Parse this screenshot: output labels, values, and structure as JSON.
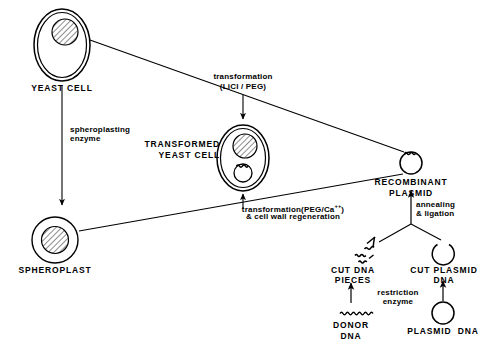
{
  "diagram": {
    "background_color": "#ffffff",
    "stroke_color": "#000000",
    "width": 490,
    "height": 356
  },
  "nodes": {
    "yeast_cell": {
      "label": "YEAST CELL",
      "shape": "double-walled-oval-with-hatched-nucleus"
    },
    "transformed_yeast_cell": {
      "label_line1": "TRANSFORMED",
      "label_line2": "YEAST CELL",
      "shape": "double-walled-oval-with-hatched-nucleus-and-plasmid"
    },
    "spheroplast": {
      "label": "SPHEROPLAST",
      "shape": "single-wall-circle-with-hatched-nucleus"
    },
    "recombinant_plasmid": {
      "label_line1": "RECOMBINANT",
      "label_line2": "PLASMID",
      "shape": "circle-with-squiggle-insert"
    },
    "cut_dna_pieces": {
      "label_line1": "CUT DNA",
      "label_line2": "PIECES",
      "shape": "squiggle-fragments"
    },
    "cut_plasmid_dna": {
      "label_line1": "CUT PLASMID",
      "label_line2": "DNA",
      "shape": "open-circle"
    },
    "donor_dna": {
      "label_line1": "DONOR",
      "label_line2": "DNA",
      "shape": "wavy-line"
    },
    "plasmid_dna": {
      "label": "PLASMID  DNA",
      "shape": "closed-circle"
    }
  },
  "process_labels": {
    "transformation_licl_peg_line1": "transformation",
    "transformation_licl_peg_line2": "(LiCI / PEG)",
    "spheroplasting_enzyme_line1": "spheroplasting",
    "spheroplasting_enzyme_line2": "enzyme",
    "transformation_peg_ca_line1_a": "transformation(PEG/Ca",
    "transformation_peg_ca_line1_sup": "++",
    "transformation_peg_ca_line1_b": ")",
    "transformation_peg_ca_line2": "& cell wall regeneration",
    "annealing_ligation_line1": "annealing",
    "annealing_ligation_line2": "& ligation",
    "restriction_enzyme_line1": "restriction",
    "restriction_enzyme_line2": "enzyme"
  }
}
